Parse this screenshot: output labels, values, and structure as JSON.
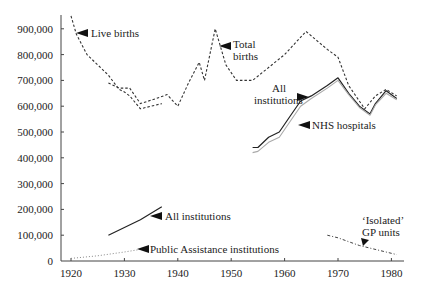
{
  "chart_data": {
    "type": "line",
    "title": "",
    "xlabel": "",
    "ylabel": "",
    "xlim": [
      1918,
      1982
    ],
    "ylim": [
      0,
      950000
    ],
    "grid": false,
    "x_ticks": [
      1920,
      1930,
      1940,
      1950,
      1960,
      1970,
      1980
    ],
    "y_ticks": [
      0,
      100000,
      200000,
      300000,
      400000,
      500000,
      600000,
      700000,
      800000,
      900000
    ],
    "y_tick_labels": [
      "0",
      "100,000",
      "200,000",
      "300,000",
      "400,000",
      "500,000",
      "600,000",
      "700,000",
      "800,000",
      "900,000"
    ],
    "series": [
      {
        "name": "Live births",
        "style": "dashed",
        "x": [
          1920,
          1921,
          1923,
          1925,
          1927,
          1929,
          1930,
          1931,
          1933,
          1935,
          1937
        ],
        "values": [
          950000,
          880000,
          800000,
          760000,
          720000,
          665000,
          655000,
          640000,
          590000,
          600000,
          610000
        ]
      },
      {
        "name": "Total births",
        "style": "dashed",
        "x": [
          1927,
          1929,
          1931,
          1933,
          1936,
          1938,
          1940,
          1942,
          1944,
          1945,
          1947,
          1949,
          1951,
          1954,
          1957,
          1960,
          1964,
          1968,
          1970,
          1972,
          1975,
          1977,
          1979,
          1981
        ],
        "values": [
          690000,
          670000,
          670000,
          610000,
          630000,
          645000,
          600000,
          690000,
          770000,
          700000,
          900000,
          760000,
          700000,
          700000,
          750000,
          800000,
          890000,
          820000,
          790000,
          680000,
          590000,
          640000,
          665000,
          640000
        ]
      },
      {
        "name": "All institutions (1927-1937)",
        "style": "solid",
        "x": [
          1927,
          1930,
          1933,
          1937
        ],
        "values": [
          100000,
          130000,
          160000,
          210000
        ]
      },
      {
        "name": "Public Assistance institutions",
        "style": "dotted",
        "x": [
          1920,
          1925,
          1930,
          1933
        ],
        "values": [
          10000,
          20000,
          35000,
          45000
        ]
      },
      {
        "name": "All institutions (1954-1981)",
        "style": "solid",
        "x": [
          1954,
          1955,
          1957,
          1959,
          1961,
          1963,
          1965,
          1968,
          1970,
          1972,
          1974,
          1976,
          1977,
          1979,
          1981
        ],
        "values": [
          440000,
          440000,
          480000,
          500000,
          560000,
          620000,
          640000,
          680000,
          710000,
          650000,
          600000,
          570000,
          610000,
          660000,
          630000
        ]
      },
      {
        "name": "NHS hospitals",
        "style": "solid-light",
        "x": [
          1954,
          1955,
          1957,
          1959,
          1961,
          1963,
          1965,
          1968,
          1970,
          1972,
          1974,
          1976,
          1977,
          1979,
          1981
        ],
        "values": [
          420000,
          425000,
          460000,
          480000,
          540000,
          600000,
          630000,
          670000,
          700000,
          645000,
          595000,
          565000,
          605000,
          650000,
          625000
        ]
      },
      {
        "name": "'Isolated' GP units",
        "style": "dash-dot",
        "x": [
          1968,
          1970,
          1972,
          1974,
          1976,
          1978,
          1981
        ],
        "values": [
          100000,
          90000,
          75000,
          60000,
          50000,
          40000,
          25000
        ]
      }
    ],
    "annotations": [
      {
        "text": "Live births",
        "x": 1921,
        "y": 880000
      },
      {
        "text": "Total births",
        "x": 1948,
        "y": 860000
      },
      {
        "text": "All institutions",
        "x": 1966,
        "y": 640000
      },
      {
        "text": "NHS hospitals",
        "x": 1962,
        "y": 540000
      },
      {
        "text": "All institutions",
        "x": 1935,
        "y": 175000
      },
      {
        "text": "Public Assistance institutions",
        "x": 1933,
        "y": 45000
      },
      {
        "text": "'Isolated' GP units",
        "x": 1974,
        "y": 110000
      }
    ]
  },
  "labels": {
    "live_births": "Live births",
    "total_line1": "Total",
    "total_line2": "births",
    "all_inst_line1": "All",
    "all_inst_line2": "institutions",
    "nhs": "NHS hospitals",
    "all_inst_low": "All institutions",
    "public_assist": "Public Assistance institutions",
    "gp_line1": "‘Isolated’",
    "gp_line2": "GP units"
  }
}
